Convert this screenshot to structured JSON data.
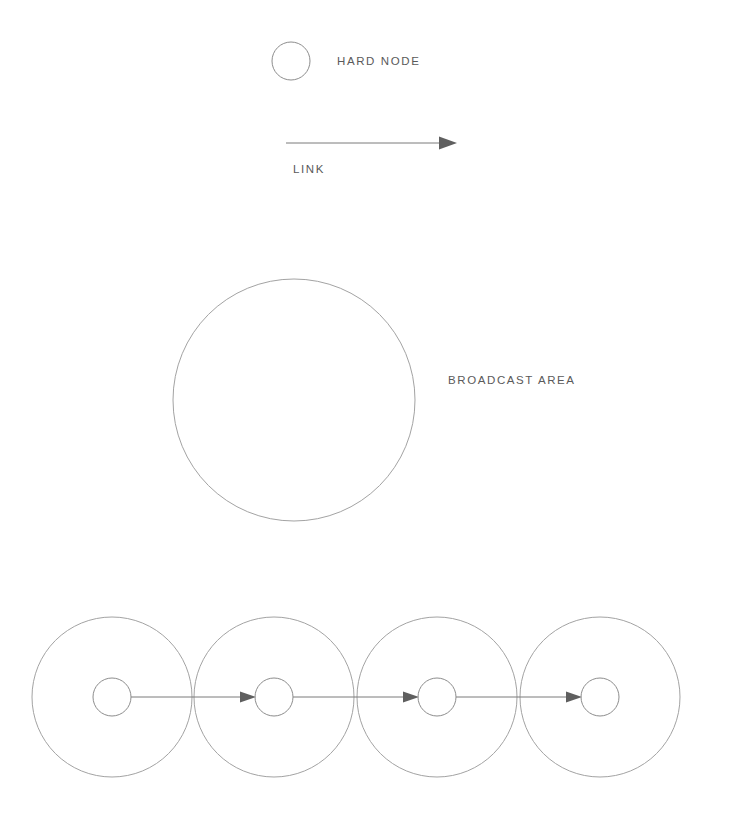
{
  "canvas": {
    "width": 730,
    "height": 819,
    "background": "#ffffff",
    "stroke_color": "#8d8d8d",
    "soft_stroke_color": "#a3a3a3",
    "line_color": "#7b7b7b",
    "arrow_color": "#5f5f5f",
    "text_color": "#5a5a5a"
  },
  "legend": {
    "hard_node": {
      "label": "HARD NODE",
      "symbol": "circle-outline",
      "circle": {
        "cx": 291,
        "cy": 61,
        "r": 19
      },
      "label_x": 337,
      "label_y": 65
    },
    "link": {
      "label": "LINK",
      "symbol": "arrow-right",
      "line": {
        "x1": 286,
        "y1": 143,
        "x2": 446,
        "y2": 143
      },
      "arrow_tip_x": 457,
      "label_x": 293,
      "label_y": 173
    },
    "broadcast_area": {
      "label": "BROADCAST AREA",
      "symbol": "large-circle-outline",
      "circle": {
        "cx": 294,
        "cy": 400,
        "r": 121
      },
      "label_x": 448,
      "label_y": 384
    }
  },
  "chain": {
    "baseline_y": 697,
    "broadcast_radius": 80,
    "node_radius": 19,
    "nodes": [
      {
        "id": "node-1",
        "cx": 112
      },
      {
        "id": "node-2",
        "cx": 274
      },
      {
        "id": "node-3",
        "cx": 437
      },
      {
        "id": "node-4",
        "cx": 600
      }
    ],
    "links": [
      {
        "id": "link-1-2",
        "from": "node-1",
        "to": "node-2"
      },
      {
        "id": "link-2-3",
        "from": "node-2",
        "to": "node-3"
      },
      {
        "id": "link-3-4",
        "from": "node-3",
        "to": "node-4"
      }
    ]
  }
}
